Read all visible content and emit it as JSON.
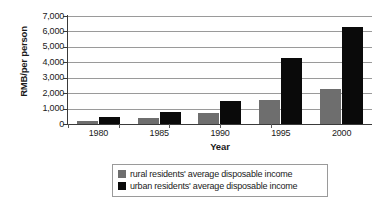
{
  "chart_data": {
    "type": "bar",
    "title": "",
    "subtitle": "",
    "xlabel": "Year",
    "ylabel": "RMB/per person",
    "categories": [
      "1980",
      "1985",
      "1990",
      "1995",
      "2000"
    ],
    "series": [
      {
        "name": "rural residents' average disposable income",
        "color": "#6e6e6e",
        "values": [
          190,
          420,
          700,
          1580,
          2250
        ]
      },
      {
        "name": "urban residents' average disposable income",
        "color": "#0a0a0a",
        "values": [
          480,
          790,
          1510,
          4280,
          6280
        ]
      }
    ],
    "ylim": [
      0,
      7000
    ],
    "ytick_values": [
      7000,
      6000,
      5000,
      4000,
      3000,
      2000,
      1000,
      0
    ],
    "ytick_labels": [
      "7,000",
      "6,000",
      "5,000",
      "4,000",
      "3,000",
      "2,000",
      "1,000",
      "0"
    ],
    "grid": "horizontal",
    "legend_position": "bottom-center",
    "background_color": "#ffffff",
    "gridline_color": "#9a9a9a",
    "axis_color": "#3a3a3a"
  },
  "legend": {
    "items": [
      {
        "label": "rural residents' average disposable income",
        "swatch": "rural-swatch"
      },
      {
        "label": "urban residents' average disposable income",
        "swatch": "urban-swatch"
      }
    ]
  }
}
